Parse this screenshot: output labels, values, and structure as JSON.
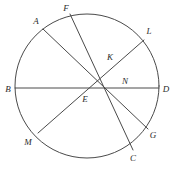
{
  "figure": {
    "type": "geometry-diagram",
    "background_color": "#ffffff",
    "stroke_color": "#4a4a4a",
    "label_color": "#2b2b2b",
    "canvas": {
      "width": 174,
      "height": 176
    }
  },
  "circle": {
    "name": "main-circle",
    "center_x": 87,
    "center_y": 86,
    "radius": 72
  },
  "segments": [
    {
      "id": "BD",
      "name": "chord-b-d",
      "from": "B",
      "to": "D",
      "x1": 15,
      "y1": 88,
      "x2": 159,
      "y2": 88
    },
    {
      "id": "AG",
      "name": "chord-a-g",
      "from": "A",
      "to": "G",
      "x1": 43,
      "y1": 29,
      "x2": 148,
      "y2": 129
    },
    {
      "id": "FC",
      "name": "chord-f-c",
      "from": "F",
      "to": "C",
      "x1": 70,
      "y1": 14,
      "x2": 133,
      "y2": 150
    },
    {
      "id": "ML",
      "name": "chord-m-l",
      "from": "M",
      "to": "L",
      "x1": 38,
      "y1": 133,
      "x2": 144,
      "y2": 40
    }
  ],
  "labels": [
    {
      "id": "A",
      "text": "A",
      "x": 36,
      "y": 21,
      "name": "point-label-a"
    },
    {
      "id": "F",
      "text": "F",
      "x": 66,
      "y": 8,
      "name": "point-label-f"
    },
    {
      "id": "L",
      "text": "L",
      "x": 149,
      "y": 31,
      "name": "point-label-l"
    },
    {
      "id": "K",
      "text": "K",
      "x": 110,
      "y": 57,
      "name": "point-label-k"
    },
    {
      "id": "N",
      "text": "N",
      "x": 125,
      "y": 81,
      "name": "point-label-n"
    },
    {
      "id": "B",
      "text": "B",
      "x": 8,
      "y": 89,
      "name": "point-label-b"
    },
    {
      "id": "D",
      "text": "D",
      "x": 166,
      "y": 89,
      "name": "point-label-d"
    },
    {
      "id": "E",
      "text": "E",
      "x": 85,
      "y": 99,
      "name": "point-label-e"
    },
    {
      "id": "G",
      "text": "G",
      "x": 153,
      "y": 135,
      "name": "point-label-g"
    },
    {
      "id": "M",
      "text": "M",
      "x": 28,
      "y": 142,
      "name": "point-label-m"
    },
    {
      "id": "C",
      "text": "C",
      "x": 133,
      "y": 158,
      "name": "point-label-c"
    }
  ],
  "intersections": [
    {
      "id": "E",
      "name": "intersection-e",
      "x": 88,
      "y": 88,
      "of": [
        "BD",
        "AG",
        "FC",
        "ML"
      ]
    },
    {
      "id": "K",
      "name": "intersection-k",
      "x": 108,
      "y": 61,
      "of": [
        "FC",
        "ML"
      ]
    },
    {
      "id": "N",
      "name": "intersection-n",
      "x": 118,
      "y": 80,
      "of": [
        "ML",
        "BD"
      ]
    }
  ]
}
